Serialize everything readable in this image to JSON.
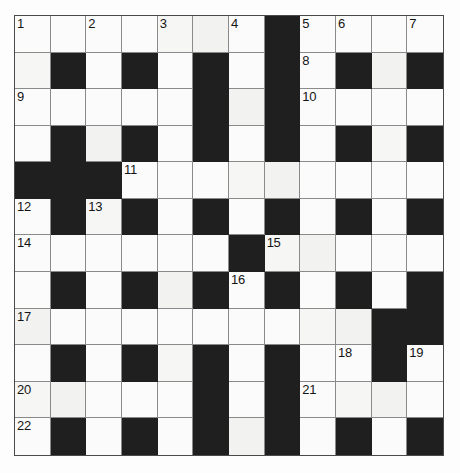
{
  "puzzle": {
    "title": "Crossword Grid",
    "rows": 12,
    "columns": 12,
    "colors": {
      "block": "#201f1f",
      "cell": "#fbfbfb",
      "grid_line": "#8a8a8a",
      "border": "#4a4a4a",
      "number_text": "#141414",
      "page_background": "#ffffff"
    },
    "clue_numbers": [
      1,
      2,
      3,
      4,
      5,
      6,
      7,
      8,
      9,
      10,
      11,
      12,
      13,
      14,
      15,
      16,
      17,
      18,
      19,
      20,
      21,
      22,
      23
    ],
    "numbered_cells": [
      {
        "number": 1,
        "row": 1,
        "col": 1
      },
      {
        "number": 2,
        "row": 1,
        "col": 3
      },
      {
        "number": 3,
        "row": 1,
        "col": 5
      },
      {
        "number": 4,
        "row": 1,
        "col": 7
      },
      {
        "number": 5,
        "row": 1,
        "col": 9
      },
      {
        "number": 6,
        "row": 1,
        "col": 10
      },
      {
        "number": 7,
        "row": 1,
        "col": 12
      },
      {
        "number": 8,
        "row": 2,
        "col": 9
      },
      {
        "number": 9,
        "row": 3,
        "col": 1
      },
      {
        "number": 10,
        "row": 3,
        "col": 9
      },
      {
        "number": 11,
        "row": 5,
        "col": 4
      },
      {
        "number": 12,
        "row": 6,
        "col": 1
      },
      {
        "number": 13,
        "row": 6,
        "col": 3
      },
      {
        "number": 14,
        "row": 7,
        "col": 1
      },
      {
        "number": 15,
        "row": 7,
        "col": 8
      },
      {
        "number": 16,
        "row": 8,
        "col": 7
      },
      {
        "number": 17,
        "row": 9,
        "col": 1
      },
      {
        "number": 18,
        "row": 10,
        "col": 10
      },
      {
        "number": 19,
        "row": 10,
        "col": 12
      },
      {
        "number": 20,
        "row": 11,
        "col": 1
      },
      {
        "number": 21,
        "row": 11,
        "col": 9
      },
      {
        "number": 22,
        "row": 12,
        "col": 1
      },
      {
        "number": 23,
        "row": 12,
        "col": 6
      }
    ],
    "grid": [
      [
        "white",
        "white",
        "white",
        "white",
        "white",
        "white",
        "white",
        "block",
        "white",
        "white",
        "white",
        "white"
      ],
      [
        "white",
        "block",
        "white",
        "block",
        "white",
        "block",
        "white",
        "block",
        "white",
        "block",
        "white",
        "block"
      ],
      [
        "white",
        "white",
        "white",
        "white",
        "white",
        "block",
        "white",
        "block",
        "white",
        "white",
        "white",
        "white"
      ],
      [
        "white",
        "block",
        "white",
        "block",
        "white",
        "block",
        "white",
        "block",
        "white",
        "block",
        "white",
        "block"
      ],
      [
        "block",
        "block",
        "block",
        "white",
        "white",
        "white",
        "white",
        "white",
        "white",
        "white",
        "white",
        "white"
      ],
      [
        "white",
        "block",
        "white",
        "block",
        "white",
        "block",
        "white",
        "block",
        "white",
        "block",
        "white",
        "block"
      ],
      [
        "white",
        "white",
        "white",
        "white",
        "white",
        "white",
        "block",
        "white",
        "white",
        "white",
        "white",
        "white"
      ],
      [
        "white",
        "block",
        "white",
        "block",
        "white",
        "block",
        "white",
        "block",
        "white",
        "block",
        "white",
        "block"
      ],
      [
        "white",
        "white",
        "white",
        "white",
        "white",
        "white",
        "white",
        "white",
        "white",
        "white",
        "block",
        "block"
      ],
      [
        "white",
        "block",
        "white",
        "block",
        "white",
        "block",
        "white",
        "block",
        "white",
        "white",
        "block",
        "white"
      ],
      [
        "white",
        "white",
        "white",
        "white",
        "white",
        "block",
        "white",
        "block",
        "white",
        "white",
        "white",
        "white"
      ],
      [
        "white",
        "block",
        "white",
        "block",
        "white",
        "block",
        "white",
        "block",
        "white",
        "block",
        "white",
        "block"
      ],
      [
        "white",
        "white",
        "white",
        "white",
        "block",
        "white",
        "white",
        "white",
        "white",
        "white",
        "white",
        "white"
      ]
    ],
    "grid_rows": [
      {
        "index": 1,
        "cells": [
          "white",
          "white",
          "white",
          "white",
          "white",
          "white",
          "white",
          "block",
          "white",
          "white",
          "white",
          "white"
        ]
      },
      {
        "index": 2,
        "cells": [
          "white",
          "block",
          "white",
          "block",
          "white",
          "block",
          "white",
          "block",
          "white",
          "block",
          "white",
          "block"
        ]
      },
      {
        "index": 3,
        "cells": [
          "white",
          "white",
          "white",
          "white",
          "white",
          "block",
          "white",
          "block",
          "white",
          "white",
          "white",
          "white"
        ]
      },
      {
        "index": 4,
        "cells": [
          "white",
          "block",
          "white",
          "block",
          "white",
          "block",
          "white",
          "block",
          "white",
          "block",
          "white",
          "block"
        ]
      },
      {
        "index": 5,
        "cells": [
          "block",
          "block",
          "block",
          "white",
          "white",
          "white",
          "white",
          "white",
          "white",
          "white",
          "white",
          "white"
        ]
      },
      {
        "index": 6,
        "cells": [
          "white",
          "block",
          "white",
          "block",
          "white",
          "block",
          "white",
          "block",
          "white",
          "block",
          "white",
          "block"
        ]
      },
      {
        "index": 7,
        "cells": [
          "white",
          "white",
          "white",
          "white",
          "white",
          "white",
          "block",
          "white",
          "white",
          "white",
          "white",
          "white"
        ]
      },
      {
        "index": 8,
        "cells": [
          "white",
          "block",
          "white",
          "block",
          "white",
          "block",
          "white",
          "block",
          "white",
          "block",
          "white",
          "block"
        ]
      },
      {
        "index": 9,
        "cells": [
          "white",
          "white",
          "white",
          "white",
          "white",
          "white",
          "white",
          "white",
          "white",
          "white",
          "block",
          "block"
        ]
      },
      {
        "index": 10,
        "cells": [
          "white",
          "block",
          "white",
          "block",
          "white",
          "block",
          "white",
          "block",
          "white",
          "white",
          "block",
          "white"
        ]
      },
      {
        "index": 11,
        "cells": [
          "white",
          "white",
          "white",
          "white",
          "white",
          "block",
          "white",
          "block",
          "white",
          "white",
          "white",
          "white"
        ]
      },
      {
        "index": 12,
        "cells": [
          "white",
          "block",
          "white",
          "block",
          "white",
          "block",
          "white",
          "block",
          "white",
          "block",
          "white",
          "block"
        ]
      }
    ]
  }
}
